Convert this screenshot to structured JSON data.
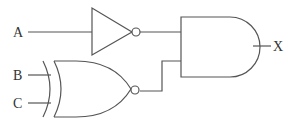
{
  "diagram": {
    "type": "logic-circuit",
    "inputs": [
      "A",
      "B",
      "C"
    ],
    "output": "X",
    "gates": [
      {
        "id": "not1",
        "type": "NOT",
        "inputs": [
          "A"
        ]
      },
      {
        "id": "xnor1",
        "type": "XNOR",
        "inputs": [
          "B",
          "C"
        ]
      },
      {
        "id": "and1",
        "type": "AND",
        "inputs": [
          "not1",
          "xnor1"
        ],
        "output": "X"
      }
    ],
    "labels": {
      "input_a": "A",
      "input_b": "B",
      "input_c": "C",
      "output_x": "X"
    },
    "colors": {
      "stroke": "#555555",
      "background": "#ffffff",
      "text": "#333333"
    }
  }
}
